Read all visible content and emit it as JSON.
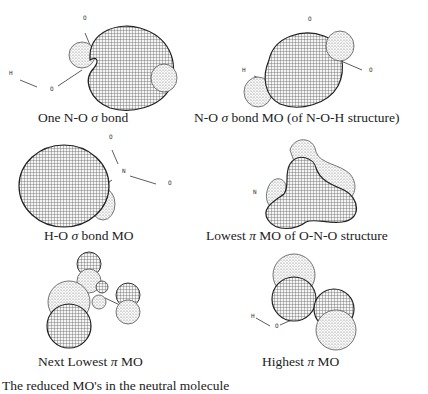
{
  "figure": {
    "panels": [
      {
        "id": "p1",
        "caption_pre": "One N-O ",
        "caption_sym": "σ",
        "caption_post": " bond",
        "atoms": [
          "O",
          "H",
          "O"
        ]
      },
      {
        "id": "p2",
        "caption_pre": "N-O ",
        "caption_sym": "σ",
        "caption_post": " bond MO (of N-O-H structure)",
        "atoms": [
          "O",
          "H",
          "O"
        ]
      },
      {
        "id": "p3",
        "caption_pre": "H-O ",
        "caption_sym": "σ",
        "caption_post": " bond MO",
        "atoms": [
          "O",
          "N",
          "O"
        ]
      },
      {
        "id": "p4",
        "caption_pre": "Lowest ",
        "caption_sym": "π",
        "caption_post": " MO of O-N-O structure",
        "atoms": [
          "N"
        ]
      },
      {
        "id": "p5",
        "caption_pre": "Next Lowest ",
        "caption_sym": "π",
        "caption_post": " MO",
        "atoms": []
      },
      {
        "id": "p6",
        "caption_pre": "Highest ",
        "caption_sym": "π",
        "caption_post": " MO",
        "atoms": [
          "H",
          "O"
        ]
      }
    ],
    "footer_text": "The reduced MO's in the neutral molecule"
  },
  "colors": {
    "mesh": "#2b2b2b",
    "light_lobe": "#8a8a8a",
    "background": "#ffffff"
  }
}
